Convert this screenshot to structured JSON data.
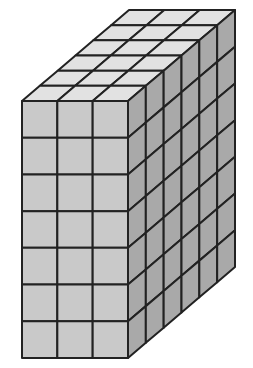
{
  "figure": {
    "description": "Rectangular prism built from unit cubes",
    "dimensions": {
      "width": 3,
      "height": 7,
      "depth": 6
    },
    "colors": {
      "background": "#ffffff",
      "top_face": "#e2e2e2",
      "front_face": "#c9c9c9",
      "side_face": "#a9a9a9",
      "edge": "#222222"
    },
    "geometry": {
      "front_top_left": [
        22,
        101
      ],
      "front_top_right": [
        128,
        101
      ],
      "front_bottom_left": [
        22,
        358
      ],
      "front_bottom_right": [
        128,
        358
      ],
      "back_top_left": [
        129,
        10
      ],
      "back_top_right": [
        235,
        10
      ],
      "back_bottom_right": [
        235,
        267
      ]
    }
  }
}
